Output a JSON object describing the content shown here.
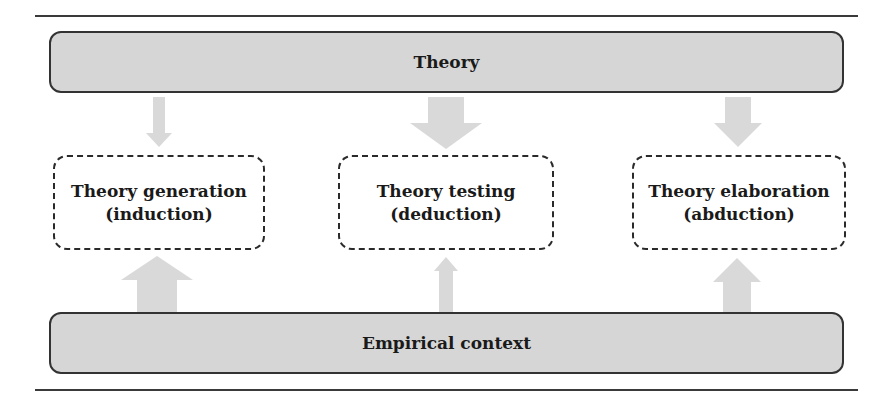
{
  "diagram": {
    "top_band": {
      "label": "Theory"
    },
    "bottom_band": {
      "label": "Empirical context"
    },
    "nodes": [
      {
        "title": "Theory generation",
        "subtitle": "(induction)"
      },
      {
        "title": "Theory testing",
        "subtitle": "(deduction)"
      },
      {
        "title": "Theory elaboration",
        "subtitle": "(abduction)"
      }
    ],
    "arrows": {
      "theory_to_nodes": [
        {
          "target": "Theory generation",
          "direction": "down",
          "weight": "thin"
        },
        {
          "target": "Theory testing",
          "direction": "down",
          "weight": "thick"
        },
        {
          "target": "Theory elaboration",
          "direction": "down",
          "weight": "medium"
        }
      ],
      "context_to_nodes": [
        {
          "target": "Theory generation",
          "direction": "up",
          "weight": "thick"
        },
        {
          "target": "Theory testing",
          "direction": "up",
          "weight": "thin"
        },
        {
          "target": "Theory elaboration",
          "direction": "up",
          "weight": "medium"
        }
      ]
    },
    "colors": {
      "band_fill": "#d6d6d6",
      "border": "#333333",
      "arrow_fill": "#d9d9d9",
      "background": "#ffffff"
    }
  }
}
